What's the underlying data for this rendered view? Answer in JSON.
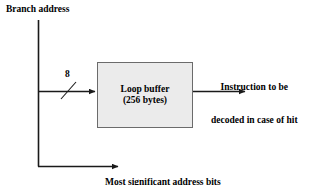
{
  "diagram": {
    "background_color": "#ffffff",
    "line_color": "#1a1a1a",
    "box_fill_color": "#ebebeb",
    "box_border_color": "#6b6b6b",
    "labels": {
      "branch_address": "Branch address",
      "bit_width": "8",
      "instruction_output_line1": "Instruction to be",
      "instruction_output_line2": "decoded in case of hit",
      "msb_compare_line1": "Most significant address bits",
      "msb_compare_line2": "compared to determine a hit"
    },
    "box": {
      "line1": "Loop buffer",
      "line2": "(256 bytes)"
    }
  }
}
